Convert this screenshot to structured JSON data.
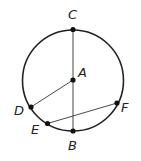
{
  "diagram": {
    "type": "circle-geometry",
    "circle": {
      "center": "A",
      "cx": 73,
      "cy": 80.5,
      "r": 50.5
    },
    "points": [
      {
        "id": "A",
        "label": "A",
        "x": 73,
        "y": 80,
        "lx": 80,
        "ly": 77
      },
      {
        "id": "B",
        "label": "B",
        "x": 73,
        "y": 131,
        "lx": 73,
        "ly": 150
      },
      {
        "id": "C",
        "label": "C",
        "x": 73,
        "y": 29.5,
        "lx": 73,
        "ly": 19
      },
      {
        "id": "D",
        "label": "D",
        "x": 31,
        "y": 107,
        "lx": 21,
        "ly": 115
      },
      {
        "id": "E",
        "label": "E",
        "x": 47.5,
        "y": 123.5,
        "lx": 37,
        "ly": 133
      },
      {
        "id": "F",
        "label": "F",
        "x": 117,
        "y": 103,
        "lx": 126,
        "ly": 112
      }
    ],
    "segments": [
      {
        "id": "CB",
        "from": "C",
        "to": "B"
      },
      {
        "id": "AD",
        "from": "A",
        "to": "D"
      },
      {
        "id": "EF",
        "from": "E",
        "to": "F"
      }
    ]
  }
}
